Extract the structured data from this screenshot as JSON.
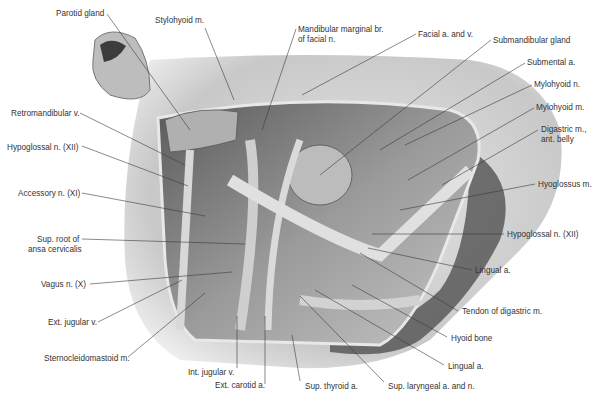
{
  "figure": {
    "colors": {
      "background": "#ffffff",
      "skin": "#d6d6d6",
      "skin_shadow": "#6a6a6a",
      "cavity": "#8a8a8a",
      "dark": "#2a2a2a",
      "leader": "#3a3a3a",
      "text": "#333333"
    }
  },
  "labels": [
    {
      "id": "parotid-gland",
      "text": "Parotid gland",
      "x": 56,
      "y": 9,
      "lx": 107,
      "ly": 14,
      "tx": 190,
      "ty": 130
    },
    {
      "id": "stylohyoid-m",
      "text": "Stylohyoid m.",
      "x": 155,
      "y": 16,
      "lx": 205,
      "ly": 28,
      "tx": 234,
      "ty": 100
    },
    {
      "id": "mandibular-marginal-br",
      "text": "Mandibular marginal br.",
      "x": 298,
      "y": 25,
      "lx": 296,
      "ly": 29,
      "tx": 262,
      "ty": 130
    },
    {
      "id": "mandibular-marginal-br-2",
      "text": "of facial n.",
      "x": 298,
      "y": 35
    },
    {
      "id": "facial-a-and-v",
      "text": "Facial a. and v.",
      "x": 418,
      "y": 30,
      "lx": 416,
      "ly": 34,
      "tx": 302,
      "ty": 95
    },
    {
      "id": "submandibular-gland",
      "text": "Submandibular gland",
      "x": 493,
      "y": 36,
      "lx": 491,
      "ly": 40,
      "tx": 320,
      "ty": 175
    },
    {
      "id": "submental-a",
      "text": "Submental a.",
      "x": 527,
      "y": 58,
      "lx": 525,
      "ly": 63,
      "tx": 380,
      "ty": 150
    },
    {
      "id": "mylohyoid-n",
      "text": "Mylohyoid n.",
      "x": 534,
      "y": 80,
      "lx": 532,
      "ly": 85,
      "tx": 405,
      "ty": 145
    },
    {
      "id": "mylohyoid-m",
      "text": "Mylohyoid m.",
      "x": 536,
      "y": 103,
      "lx": 534,
      "ly": 108,
      "tx": 408,
      "ty": 180
    },
    {
      "id": "digastric-m-ant-belly",
      "text": "Digastric m.,",
      "x": 541,
      "y": 125,
      "lx": 538,
      "ly": 130,
      "tx": 442,
      "ty": 185
    },
    {
      "id": "digastric-m-ant-belly-2",
      "text": "ant. belly",
      "x": 541,
      "y": 135
    },
    {
      "id": "hyoglossus-m",
      "text": "Hyoglossus m.",
      "x": 538,
      "y": 180,
      "lx": 535,
      "ly": 184,
      "tx": 400,
      "ty": 210
    },
    {
      "id": "hypoglossal-n-right",
      "text": "Hypoglossal n. (XII)",
      "x": 507,
      "y": 230,
      "lx": 504,
      "ly": 234,
      "tx": 372,
      "ty": 234
    },
    {
      "id": "lingual-a-upper",
      "text": "Lingual a.",
      "x": 475,
      "y": 266,
      "lx": 472,
      "ly": 270,
      "tx": 368,
      "ty": 248
    },
    {
      "id": "tendon-of-digastric-m",
      "text": "Tendon of digastric m.",
      "x": 462,
      "y": 307,
      "lx": 458,
      "ly": 311,
      "tx": 360,
      "ty": 253
    },
    {
      "id": "hyoid-bone",
      "text": "Hyoid bone",
      "x": 451,
      "y": 334,
      "lx": 447,
      "ly": 337,
      "tx": 352,
      "ty": 285
    },
    {
      "id": "lingual-a-lower",
      "text": "Lingual a.",
      "x": 448,
      "y": 362,
      "lx": 444,
      "ly": 365,
      "tx": 315,
      "ty": 290
    },
    {
      "id": "sup-laryngeal-a-and-n",
      "text": "Sup. laryngeal a. and n.",
      "x": 388,
      "y": 382,
      "lx": 384,
      "ly": 382,
      "tx": 300,
      "ty": 296
    },
    {
      "id": "sup-thyroid-a",
      "text": "Sup. thyroid a.",
      "x": 305,
      "y": 382,
      "lx": 300,
      "ly": 381,
      "tx": 292,
      "ty": 335
    },
    {
      "id": "ext-carotid-a",
      "text": "Ext. carotid a.",
      "x": 215,
      "y": 381,
      "lx": 265,
      "ly": 384,
      "tx": 265,
      "ty": 316
    },
    {
      "id": "int-jugular-v",
      "text": "Int. jugular v.",
      "x": 188,
      "y": 368,
      "lx": 237,
      "ly": 368,
      "tx": 237,
      "ty": 316
    },
    {
      "id": "sternocleidomastoid-m",
      "text": "Sternocleidomastoid m.",
      "x": 44,
      "y": 354,
      "lx": 128,
      "ly": 357,
      "tx": 205,
      "ty": 293
    },
    {
      "id": "ext-jugular-v",
      "text": "Ext. jugular v.",
      "x": 48,
      "y": 318,
      "lx": 98,
      "ly": 322,
      "tx": 182,
      "ty": 280
    },
    {
      "id": "vagus-n-x",
      "text": "Vagus n. (X)",
      "x": 41,
      "y": 280,
      "lx": 90,
      "ly": 284,
      "tx": 232,
      "ty": 272
    },
    {
      "id": "sup-root-ansa-cervicalis",
      "text": "Sup. root of",
      "x": 37,
      "y": 235,
      "lx": 82,
      "ly": 239,
      "tx": 245,
      "ty": 244
    },
    {
      "id": "sup-root-ansa-cervicalis-2",
      "text": "ansa cervicalis",
      "x": 28,
      "y": 245
    },
    {
      "id": "accessory-n-xi",
      "text": "Accessory n. (XI)",
      "x": 18,
      "y": 189,
      "lx": 82,
      "ly": 193,
      "tx": 205,
      "ty": 216
    },
    {
      "id": "hypoglossal-n-left",
      "text": "Hypoglossal n. (XII)",
      "x": 7,
      "y": 143,
      "lx": 82,
      "ly": 146,
      "tx": 188,
      "ty": 186
    },
    {
      "id": "retromandibular-v",
      "text": "Retromandibular v.",
      "x": 11,
      "y": 109,
      "lx": 80,
      "ly": 113,
      "tx": 185,
      "ty": 165
    }
  ]
}
